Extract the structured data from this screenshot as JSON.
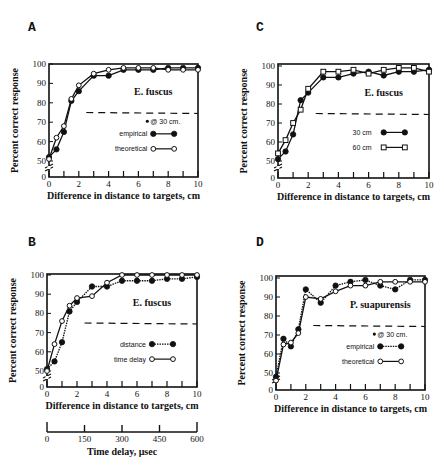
{
  "panel_letters": [
    "A",
    "B",
    "C",
    "D"
  ],
  "chart_data": [
    {
      "id": "A",
      "type": "line",
      "title": "E. fuscus",
      "xlabel": "Difference in distance to targets, cm",
      "ylabel": "Percent correct response",
      "xlim": [
        0,
        10
      ],
      "ylim": [
        0,
        100
      ],
      "xticks": [
        0,
        2,
        4,
        6,
        8,
        10
      ],
      "yticks": [
        0,
        50,
        60,
        70,
        80,
        90,
        100
      ],
      "reference_line": 75,
      "legend_header": "@ 30 cm.",
      "series": [
        {
          "name": "empirical",
          "marker": "filled-circle",
          "line": "solid",
          "x": [
            0,
            0.5,
            1,
            1.5,
            2,
            3,
            4,
            5,
            6,
            7,
            8,
            9,
            10
          ],
          "values": [
            52,
            56,
            65,
            81,
            86,
            94,
            94,
            97,
            97,
            97,
            98,
            98,
            98
          ]
        },
        {
          "name": "theoretical",
          "marker": "open-circle",
          "line": "solid",
          "x": [
            0,
            0.5,
            1,
            1.5,
            2,
            3,
            4,
            5,
            6,
            7,
            8,
            9,
            10
          ],
          "values": [
            51,
            62,
            68,
            82,
            89,
            95,
            97,
            98,
            98,
            98,
            97,
            97,
            97
          ]
        }
      ]
    },
    {
      "id": "B",
      "type": "line",
      "title": "E. fuscus",
      "xlabel": "Difference in distance to targets, cm",
      "ylabel": "Percent correct response",
      "xlim": [
        0,
        10
      ],
      "ylim": [
        0,
        100
      ],
      "xticks": [
        0,
        2,
        4,
        6,
        8,
        10
      ],
      "yticks": [
        0,
        50,
        60,
        70,
        80,
        90,
        100
      ],
      "reference_line": 75,
      "secondary_axis": {
        "label": "Time delay, μsec",
        "ticks": [
          0,
          150,
          300,
          450,
          600
        ]
      },
      "series": [
        {
          "name": "distance",
          "marker": "filled-circle",
          "line": "dotted",
          "x": [
            0,
            0.5,
            1,
            1.5,
            2,
            3,
            4,
            5,
            6,
            7,
            8,
            9,
            10
          ],
          "values": [
            51,
            55,
            65,
            81,
            86,
            94,
            94,
            97,
            97,
            97,
            98,
            98,
            99
          ]
        },
        {
          "name": "time delay",
          "marker": "open-circle",
          "line": "solid",
          "x": [
            0,
            0.5,
            1,
            1.5,
            2,
            3,
            4,
            5,
            6,
            7,
            8,
            9,
            10
          ],
          "values": [
            50,
            64,
            76,
            84,
            88,
            89,
            96,
            100,
            100,
            100,
            100,
            100,
            100
          ]
        }
      ]
    },
    {
      "id": "C",
      "type": "line",
      "title": "E. fuscus",
      "xlabel": "Difference in distance to targets, cm",
      "ylabel": "Percent correct response",
      "xlim": [
        0,
        10
      ],
      "ylim": [
        0,
        100
      ],
      "xticks": [
        0,
        2,
        4,
        6,
        8,
        10
      ],
      "yticks": [
        0,
        50,
        60,
        70,
        80,
        90,
        100
      ],
      "reference_line": 75,
      "series": [
        {
          "name": "30 cm",
          "marker": "filled-circle",
          "line": "solid",
          "x": [
            0,
            0.5,
            1,
            1.5,
            2,
            3,
            4,
            5,
            6,
            7,
            8,
            9,
            10
          ],
          "values": [
            51,
            55,
            64,
            82,
            86,
            94,
            94,
            96,
            97,
            95,
            97,
            97,
            98
          ]
        },
        {
          "name": "60 cm",
          "marker": "open-square",
          "line": "solid",
          "x": [
            0,
            0.5,
            1,
            1.5,
            2,
            3,
            4,
            5,
            6,
            7,
            8,
            9,
            10
          ],
          "values": [
            54,
            61,
            70,
            77,
            88,
            97,
            97,
            98,
            96,
            98,
            99,
            99,
            97
          ]
        }
      ]
    },
    {
      "id": "D",
      "type": "line",
      "title": "P. suapurensis",
      "xlabel": "Difference in distance to targets, cm",
      "ylabel": "Percent correct response",
      "xlim": [
        0,
        10
      ],
      "ylim": [
        0,
        100
      ],
      "xticks": [
        0,
        2,
        4,
        6,
        8,
        10
      ],
      "yticks": [
        0,
        50,
        60,
        70,
        80,
        90,
        100
      ],
      "reference_line": 75,
      "legend_header": "@ 30 cm.",
      "series": [
        {
          "name": "empirical",
          "marker": "filled-circle",
          "line": "dotted",
          "x": [
            0,
            0.5,
            1,
            1.5,
            2,
            3,
            4,
            5,
            6,
            7,
            8,
            9,
            10
          ],
          "values": [
            48,
            68,
            64,
            73,
            94,
            87,
            96,
            98,
            99,
            96,
            94,
            99,
            99
          ]
        },
        {
          "name": "theoretical",
          "marker": "open-circle",
          "line": "solid",
          "x": [
            0,
            0.5,
            1,
            1.5,
            2,
            3,
            4,
            5,
            6,
            7,
            8,
            9,
            10
          ],
          "values": [
            46,
            65,
            66,
            71,
            90,
            89,
            93,
            96,
            96,
            98,
            98,
            98,
            98
          ]
        }
      ]
    }
  ]
}
